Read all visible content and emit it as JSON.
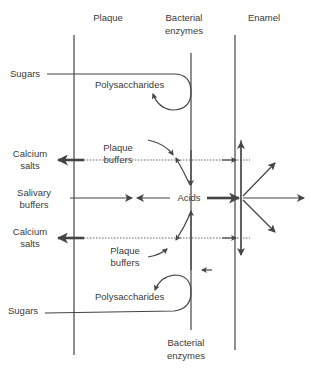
{
  "diagram": {
    "columns": {
      "plaque": "Plaque",
      "bacterial_enzymes_top_line1": "Bacterial",
      "bacterial_enzymes_top_line2": "enzymes",
      "enamel": "Enamel",
      "bacterial_enzymes_bottom_line1": "Bacterial",
      "bacterial_enzymes_bottom_line2": "enzymes"
    },
    "labels": {
      "sugars_top": "Sugars",
      "polysaccharides_top": "Polysaccharides",
      "plaque_buffers_top_line1": "Plaque",
      "plaque_buffers_top_line2": "buffers",
      "calcium_salts_top_line1": "Calcium",
      "calcium_salts_top_line2": "salts",
      "salivary_buffers_line1": "Salivary",
      "salivary_buffers_line2": "buffers",
      "acids": "Acids",
      "calcium_salts_bottom_line1": "Calcium",
      "calcium_salts_bottom_line2": "salts",
      "plaque_buffers_bottom_line1": "Plaque",
      "plaque_buffers_bottom_line2": "buffers",
      "polysaccharides_bottom": "Polysaccharides",
      "sugars_bottom": "Sugars"
    }
  }
}
